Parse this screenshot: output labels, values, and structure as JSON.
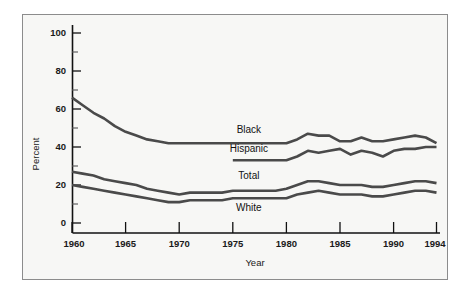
{
  "figure": {
    "background_color": "#f7f7f5",
    "border_color": "#8c8c8c",
    "line_color": "#4a4a4a",
    "text_color": "#111111"
  },
  "chart_data": {
    "type": "line",
    "title": "",
    "xlabel": "Year",
    "ylabel": "Percent",
    "xlim": [
      1960,
      1994
    ],
    "ylim": [
      0,
      100
    ],
    "grid": false,
    "legend_position": "inline-labels",
    "y_ticks_major": [
      0,
      20,
      40,
      60,
      80,
      100
    ],
    "y_ticks_minor": [
      10,
      30,
      50,
      70,
      90
    ],
    "x_ticks": [
      1960,
      1965,
      1970,
      1975,
      1980,
      1985,
      1990,
      1994
    ],
    "x_tick_labels": [
      "1960",
      "1965",
      "1970",
      "1975",
      "1980",
      "1985",
      "1990",
      "1994"
    ],
    "y_tick_labels": [
      "0",
      "20",
      "40",
      "60",
      "80",
      "100"
    ],
    "series": [
      {
        "name": "Black",
        "label": "Black",
        "x": [
          1960,
          1961,
          1962,
          1963,
          1964,
          1965,
          1966,
          1967,
          1968,
          1969,
          1970,
          1971,
          1972,
          1973,
          1974,
          1975,
          1976,
          1977,
          1978,
          1979,
          1980,
          1981,
          1982,
          1983,
          1984,
          1985,
          1986,
          1987,
          1988,
          1989,
          1990,
          1991,
          1992,
          1993,
          1994
        ],
        "values": [
          66,
          62,
          58,
          55,
          51,
          48,
          46,
          44,
          43,
          42,
          42,
          42,
          42,
          42,
          42,
          42,
          42,
          42,
          42,
          42,
          42,
          44,
          47,
          46,
          46,
          43,
          43,
          45,
          43,
          43,
          44,
          45,
          46,
          45,
          42
        ]
      },
      {
        "name": "Hispanic",
        "label": "Hispanic",
        "x": [
          1975,
          1976,
          1977,
          1978,
          1979,
          1980,
          1981,
          1982,
          1983,
          1984,
          1985,
          1986,
          1987,
          1988,
          1989,
          1990,
          1991,
          1992,
          1993,
          1994
        ],
        "values": [
          33,
          33,
          33,
          33,
          33,
          33,
          35,
          38,
          37,
          38,
          39,
          36,
          38,
          37,
          35,
          38,
          39,
          39,
          40,
          40
        ]
      },
      {
        "name": "Total",
        "label": "Total",
        "x": [
          1960,
          1961,
          1962,
          1963,
          1964,
          1965,
          1966,
          1967,
          1968,
          1969,
          1970,
          1971,
          1972,
          1973,
          1974,
          1975,
          1976,
          1977,
          1978,
          1979,
          1980,
          1981,
          1982,
          1983,
          1984,
          1985,
          1986,
          1987,
          1988,
          1989,
          1990,
          1991,
          1992,
          1993,
          1994
        ],
        "values": [
          27,
          26,
          25,
          23,
          22,
          21,
          20,
          18,
          17,
          16,
          15,
          16,
          16,
          16,
          16,
          17,
          17,
          17,
          17,
          17,
          18,
          20,
          22,
          22,
          21,
          20,
          20,
          20,
          19,
          19,
          20,
          21,
          22,
          22,
          21
        ]
      },
      {
        "name": "White",
        "label": "White",
        "x": [
          1960,
          1961,
          1962,
          1963,
          1964,
          1965,
          1966,
          1967,
          1968,
          1969,
          1970,
          1971,
          1972,
          1973,
          1974,
          1975,
          1976,
          1977,
          1978,
          1979,
          1980,
          1981,
          1982,
          1983,
          1984,
          1985,
          1986,
          1987,
          1988,
          1989,
          1990,
          1991,
          1992,
          1993,
          1994
        ],
        "values": [
          20,
          19,
          18,
          17,
          16,
          15,
          14,
          13,
          12,
          11,
          11,
          12,
          12,
          12,
          12,
          13,
          13,
          13,
          13,
          13,
          13,
          15,
          16,
          17,
          16,
          15,
          15,
          15,
          14,
          14,
          15,
          16,
          17,
          17,
          16
        ]
      }
    ],
    "inline_labels": [
      {
        "text": "Black",
        "x": 1976.5,
        "y": 47.5
      },
      {
        "text": "Hispanic",
        "x": 1976.5,
        "y": 37.5
      },
      {
        "text": "Total",
        "x": 1976.5,
        "y": 23.0
      },
      {
        "text": "White",
        "x": 1976.5,
        "y": 6.5
      }
    ]
  }
}
